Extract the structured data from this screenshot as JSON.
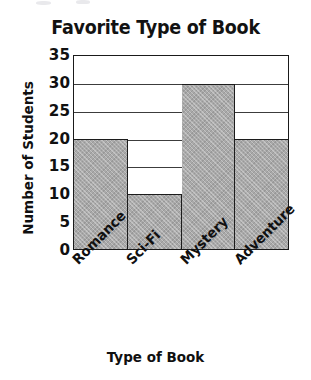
{
  "chart_data": {
    "type": "bar",
    "title": "Favorite Type of Book",
    "xlabel": "Type of Book",
    "ylabel": "Number of Students",
    "categories": [
      "Romance",
      "Sci-Fi",
      "Mystery",
      "Adventure"
    ],
    "values": [
      20,
      10,
      30,
      20
    ],
    "ylim": [
      0,
      35
    ],
    "ytick_step": 5,
    "yticks": [
      35,
      30,
      25,
      20,
      15,
      10,
      5,
      0
    ],
    "grid": "horizontal",
    "legend": "none",
    "series": [
      {
        "name": "Number of Students",
        "values": [
          20,
          10,
          30,
          20
        ]
      }
    ],
    "style": {
      "bar_fill": "#a9a9a9",
      "bar_fill_pattern": "cross-hatch",
      "bar_outline": "#1c1c1c",
      "gridline_color": "#3c3c3c",
      "frame_color": "#1a1a1a",
      "background": "#ffffff",
      "text_color": "#101010",
      "bar_gap": 0,
      "xtick_label_rotation": -45
    }
  }
}
